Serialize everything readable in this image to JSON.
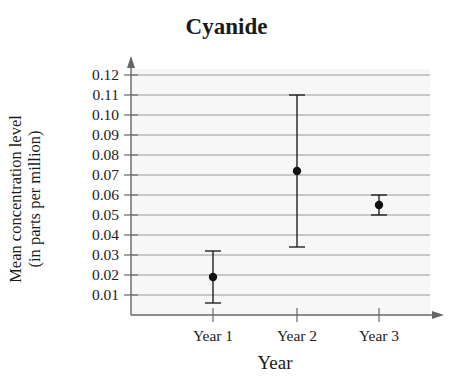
{
  "chart_data": {
    "type": "errorbar",
    "title": "Cyanide",
    "xlabel": "Year",
    "ylabel": "Mean concentration level (in parts per million)",
    "ylabel_lines": [
      "Mean concentration level",
      "(in parts per million)"
    ],
    "categories": [
      "Year 1",
      "Year 2",
      "Year 3"
    ],
    "values": [
      0.019,
      0.072,
      0.055
    ],
    "lower": [
      0.006,
      0.034,
      0.05
    ],
    "upper": [
      0.032,
      0.11,
      0.06
    ],
    "yticks": [
      "0.01",
      "0.02",
      "0.03",
      "0.04",
      "0.05",
      "0.06",
      "0.07",
      "0.08",
      "0.09",
      "0.10",
      "0.11",
      "0.12"
    ],
    "ylim": [
      0,
      0.12
    ],
    "grid": true,
    "colors": {
      "marker": "#111111",
      "grid": "#999999",
      "axis": "#666666",
      "background": "#f7f7f7"
    }
  }
}
